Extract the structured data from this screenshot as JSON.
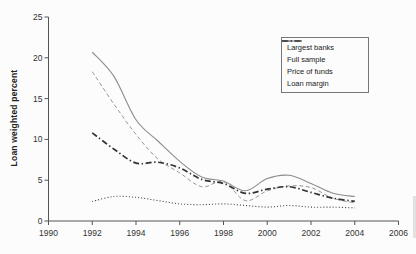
{
  "chart_data": {
    "type": "line",
    "title": "",
    "xlabel": "",
    "ylabel": "Loan weighted percent",
    "xlim": [
      1990,
      2006
    ],
    "ylim": [
      0,
      25
    ],
    "x_ticks": [
      1990,
      1992,
      1994,
      1996,
      1998,
      2000,
      2002,
      2004,
      2006
    ],
    "y_ticks": [
      0,
      5,
      10,
      15,
      20,
      25
    ],
    "grid": false,
    "legend_position": "top-right",
    "x": [
      1992,
      1993,
      1994,
      1995,
      1996,
      1997,
      1998,
      1999,
      2000,
      2001,
      2002,
      2003,
      2004
    ],
    "series": [
      {
        "name": "Largest banks",
        "line_style": "solid",
        "color": "#8c8c8c",
        "values": [
          20.7,
          17.7,
          12.4,
          9.8,
          7.3,
          5.4,
          4.9,
          3.7,
          5.2,
          5.6,
          4.6,
          3.4,
          3.0
        ]
      },
      {
        "name": "Full sample",
        "line_style": "dashed",
        "color": "#979797",
        "values": [
          18.3,
          14.3,
          10.6,
          7.6,
          5.9,
          4.2,
          4.8,
          2.5,
          3.7,
          4.3,
          4.1,
          2.8,
          2.2
        ]
      },
      {
        "name": "Price of funds",
        "line_style": "dash-dot",
        "color": "#333333",
        "values": [
          10.8,
          8.8,
          7.1,
          7.2,
          6.5,
          5.1,
          4.6,
          3.4,
          3.9,
          4.2,
          3.5,
          2.8,
          2.4
        ]
      },
      {
        "name": "Loan margin",
        "line_style": "dotted",
        "color": "#3f3f3f",
        "values": [
          2.4,
          3.0,
          2.9,
          2.5,
          2.1,
          2.0,
          2.1,
          1.9,
          1.7,
          1.9,
          1.7,
          1.7,
          1.6
        ]
      }
    ]
  }
}
